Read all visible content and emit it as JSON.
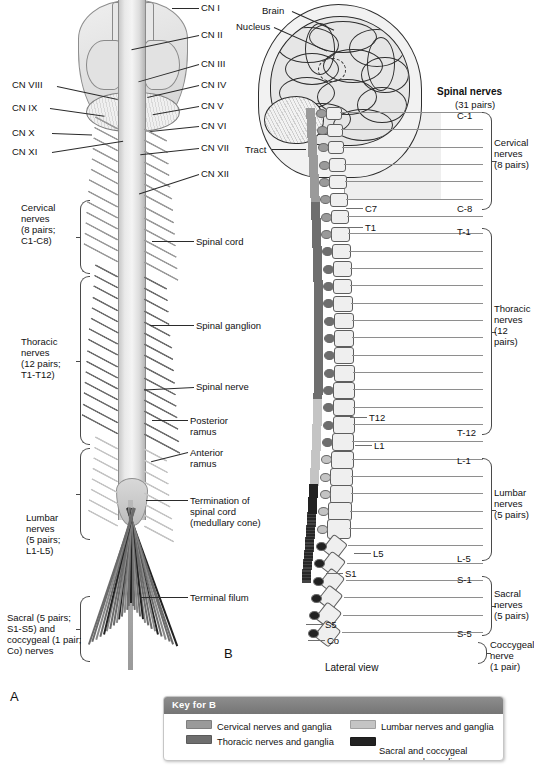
{
  "figure": {
    "panel_a_letter": "A",
    "panel_b_letter": "B",
    "panel_b_view": "Lateral view",
    "caption": ""
  },
  "panel_a": {
    "cranial_nerves_right": [
      "CN I",
      "CN II",
      "CN III",
      "CN IV",
      "CN V",
      "CN VI",
      "CN VII",
      "CN XII"
    ],
    "cranial_nerves_left": [
      "CN VIII",
      "CN IX",
      "CN X",
      "CN XI"
    ],
    "region_braces": [
      {
        "label": "Cervical\nnerves\n(8 pairs;\nC1-C8)"
      },
      {
        "label": "Thoracic\nnerves\n(12 pairs;\nT1-T12)"
      },
      {
        "label": "Lumbar\nnerves\n(5 pairs;\nL1-L5)"
      },
      {
        "label": "Sacral (5 pairs;\nS1-S5) and\ncoccygeal (1 pair;\nCo) nerves"
      }
    ],
    "structure_labels": [
      "Spinal cord",
      "Spinal ganglion",
      "Spinal nerve",
      "Posterior\nramus",
      "Anterior\nramus",
      "Termination of\nspinal cord\n(medullary cone)",
      "Terminal filum"
    ]
  },
  "panel_b": {
    "brain_label": "Brain",
    "nucleus_label": "Nucleus",
    "tract_label": "Tract",
    "heading": "Spinal nerves",
    "heading_sub": "(31 pairs)",
    "vertebra_labels": [
      "C7",
      "T1",
      "T12",
      "L1",
      "L5",
      "S1",
      "S5",
      "Co"
    ],
    "nerve_level_labels": [
      "C-1",
      "C-8",
      "T-1",
      "T-12",
      "L-1",
      "L-5",
      "S-1",
      "S-5"
    ],
    "region_braces": [
      {
        "label": "Cervical\nnerves\n(8 pairs)"
      },
      {
        "label": "Thoracic\nnerves\n(12 pairs)"
      },
      {
        "label": "Lumbar\nnerves\n(5 pairs)"
      },
      {
        "label": "Sacral\nnerves\n(5 pairs)"
      },
      {
        "label": "Coccygeal\nnerve\n(1 pair)"
      }
    ]
  },
  "key": {
    "title": "Key for B",
    "items": [
      {
        "label": "Cervical nerves and ganglia",
        "color": "#9a9a9a"
      },
      {
        "label": "Thoracic nerves and ganglia",
        "color": "#6e6e6e"
      },
      {
        "label": "Lumbar nerves and ganglia",
        "color": "#c4c4c4"
      },
      {
        "label": "Sacral and coccygeal\nnerves and ganglia",
        "color": "#222222"
      }
    ]
  }
}
